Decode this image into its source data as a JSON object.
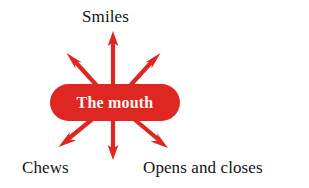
{
  "diagram": {
    "type": "radial-mind-map",
    "background_color": "#ffffff",
    "accent_color": "#DE2722",
    "label_color": "#141414",
    "center": {
      "label": "The mouth",
      "shape": "capsule",
      "fill_color": "#DE2722",
      "text_color": "#fdf6f2"
    },
    "branches": [
      {
        "label": "Smiles",
        "direction": "up",
        "arrow_count": 3
      },
      {
        "label": "Chews",
        "direction": "down-left",
        "arrow_count": 1
      },
      {
        "label": "Opens and closes",
        "direction": "down-right",
        "arrow_count": 1
      }
    ],
    "arrows": [
      {
        "name": "arrow-up",
        "from": [
          113,
          88
        ],
        "to": [
          113,
          33
        ]
      },
      {
        "name": "arrow-down",
        "from": [
          113,
          116
        ],
        "to": [
          113,
          158
        ]
      },
      {
        "name": "arrow-up-left",
        "from": [
          104,
          90
        ],
        "to": [
          68,
          55
        ]
      },
      {
        "name": "arrow-up-right",
        "from": [
          123,
          90
        ],
        "to": [
          158,
          55
        ]
      },
      {
        "name": "arrow-down-left",
        "from": [
          103,
          114
        ],
        "to": [
          60,
          146
        ]
      },
      {
        "name": "arrow-down-right",
        "from": [
          124,
          114
        ],
        "to": [
          166,
          148
        ]
      }
    ]
  }
}
